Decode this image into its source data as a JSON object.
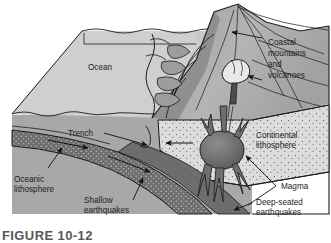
{
  "figure": {
    "caption": "FIGURE 10-12",
    "type": "block-diagram"
  },
  "labels": {
    "ocean": "Ocean",
    "trench": "Trench",
    "oceanic_lithosphere_line1": "Oceanic",
    "oceanic_lithosphere_line2": "lithosphere",
    "shallow_earthquakes_line1": "Shallow",
    "shallow_earthquakes_line2": "earthquakes",
    "coastal_line1": "Coastal",
    "coastal_line2": "mountains",
    "coastal_line3": "and",
    "coastal_line4": "volcanoes",
    "continental_lithosphere_line1": "Continental",
    "continental_lithosphere_line2": "lithosphere",
    "magma": "Magma",
    "deep_seated_line1": "Deep-seated",
    "deep_seated_line2": "earthquakes"
  },
  "colors": {
    "ocean_surface": "#c9c9c9",
    "ocean_side": "#d6d6d6",
    "crust_block": "#a8a8a8",
    "mountains": "#b0b0b0",
    "mountains_shadow": "#8f8f8f",
    "continental_lithosphere": "#d9d9d9",
    "oceanic_slab": "#6e6e6e",
    "magma": "#6b6b6b",
    "volcano": "#e8e8e8",
    "outline": "#1d1d1d",
    "label_text": "#1d1d1d",
    "caption_text": "#58585a"
  }
}
